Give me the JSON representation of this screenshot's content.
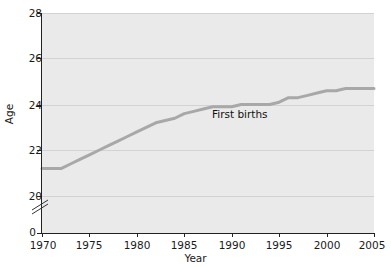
{
  "chart_data": {
    "type": "line",
    "title": "",
    "xlabel": "Year",
    "ylabel": "Age",
    "xlim": [
      1970,
      2005
    ],
    "ylim": [
      19.2,
      28
    ],
    "grid": true,
    "legend_position": "inline-annotation",
    "y_axis_break": true,
    "y_zero_label": "0",
    "x_ticks": [
      1970,
      1975,
      1980,
      1985,
      1990,
      1995,
      2000,
      2005
    ],
    "x_tick_labels": [
      "1970",
      "1975",
      "1980",
      "1985",
      "1990",
      "1995",
      "2000",
      "2005"
    ],
    "y_ticks": [
      20,
      22,
      24,
      26,
      28
    ],
    "y_tick_labels": [
      "20",
      "22",
      "24",
      "26",
      "28"
    ],
    "series": [
      {
        "name": "First births",
        "annotation": "First births",
        "color": "#a8a8a8",
        "x": [
          1970,
          1971,
          1972,
          1973,
          1974,
          1975,
          1976,
          1977,
          1978,
          1979,
          1980,
          1981,
          1982,
          1983,
          1984,
          1985,
          1986,
          1987,
          1988,
          1989,
          1990,
          1991,
          1992,
          1993,
          1994,
          1995,
          1996,
          1997,
          1998,
          1999,
          2000,
          2001,
          2002,
          2003,
          2004,
          2005
        ],
        "values": [
          21.2,
          21.2,
          21.2,
          21.4,
          21.6,
          21.8,
          22.0,
          22.2,
          22.4,
          22.6,
          22.8,
          23.0,
          23.2,
          23.3,
          23.4,
          23.6,
          23.7,
          23.8,
          23.9,
          23.9,
          23.9,
          24.0,
          24.0,
          24.0,
          24.0,
          24.1,
          24.3,
          24.3,
          24.4,
          24.5,
          24.6,
          24.6,
          24.7,
          24.7,
          24.7,
          24.7
        ]
      }
    ]
  },
  "annotations": {
    "series_label": "First births"
  },
  "colors": {
    "plot_background": "#eaeaea",
    "gridline": "#d2d2d2",
    "axis": "#222222",
    "series_line": "#a8a8a8",
    "text": "#1a1a1a",
    "page_background": "#ffffff"
  }
}
